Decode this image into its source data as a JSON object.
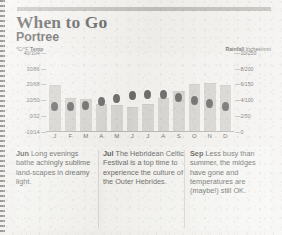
{
  "header": {
    "title": "When to Go",
    "subtitle": "Portree"
  },
  "axes": {
    "temp_caption_unit": "°C/°F",
    "temp_caption_label": "Temp",
    "rain_caption_label": "Rainfall",
    "rain_caption_unit": "Inches/mm"
  },
  "chart_data": {
    "type": "bar",
    "xlabel": "",
    "ylabel": "°C/°F Temp",
    "y2label": "Rainfall Inches/mm",
    "grid": false,
    "legend": "none",
    "categories": [
      "J",
      "F",
      "M",
      "A",
      "M",
      "J",
      "J",
      "A",
      "S",
      "O",
      "N",
      "D"
    ],
    "month_names": [
      "January",
      "February",
      "March",
      "April",
      "May",
      "June",
      "July",
      "August",
      "September",
      "October",
      "November",
      "December"
    ],
    "left_axis": {
      "label": "°C/°F Temp",
      "ticks": [
        "40/104",
        "30/86",
        "20/68",
        "10/50",
        "0/32",
        "-10/14"
      ],
      "values_c": [
        40,
        30,
        20,
        10,
        0,
        -10
      ],
      "values_f": [
        104,
        86,
        68,
        50,
        32,
        14
      ],
      "min": -10,
      "max": 40
    },
    "right_axis": {
      "label": "Rainfall Inches/mm",
      "ticks": [
        "10/250",
        "8/200",
        "6/150",
        "4/100",
        "2/50",
        "0"
      ],
      "values_in": [
        10,
        8,
        6,
        4,
        2,
        0
      ],
      "values_mm": [
        250,
        200,
        150,
        100,
        50,
        0
      ],
      "min": 0,
      "max": 10
    },
    "series": [
      {
        "name": "Rainfall",
        "unit": "inches",
        "type": "bar",
        "color": "#c9c8c4",
        "values": [
          6.0,
          4.3,
          4.2,
          3.5,
          3.4,
          3.2,
          3.6,
          4.3,
          5.2,
          6.1,
          6.2,
          6.0
        ]
      },
      {
        "name": "Temperature",
        "unit": "°C",
        "type": "scatter",
        "color": "#2a2a2a",
        "values": [
          6,
          6,
          7,
          9,
          11,
          13,
          14,
          14,
          12,
          10,
          8,
          6
        ]
      }
    ]
  },
  "blurbs": [
    {
      "month": "Jun",
      "text": " Long evenings bathe achingly sublime land-scapes in dreamy light."
    },
    {
      "month": "Jul",
      "text": " The Hebridean Celtic Festival is a top time to experience the culture of the Outer Hebrides."
    },
    {
      "month": "Sep",
      "text": " Less busy than summer, the midges have gone and temperatures are (maybe!) still OK."
    }
  ],
  "colors": {
    "paper": "#f2f1ee",
    "bar": "#c9c8c4",
    "dot": "#2a2a2a",
    "rule": "#a9a8a4",
    "text": "#1c1c1c"
  }
}
